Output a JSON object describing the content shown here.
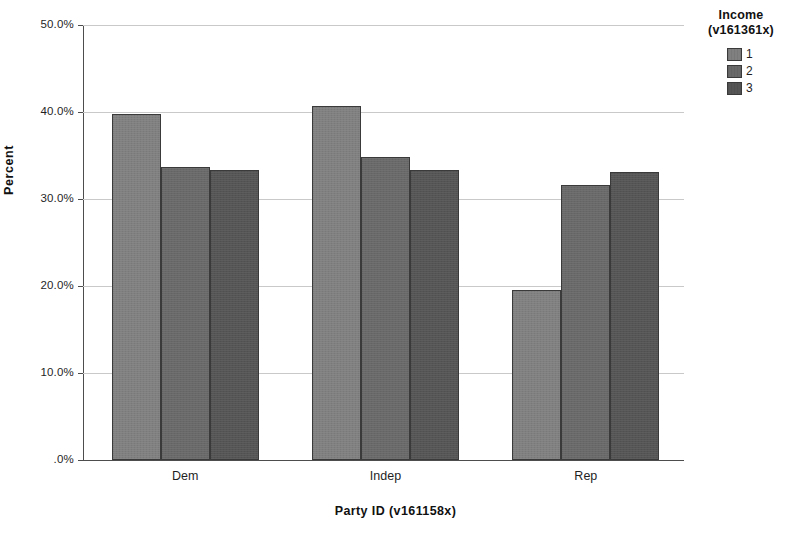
{
  "chart_data": {
    "type": "bar",
    "title": "",
    "xlabel": "Party  ID (v161158x)",
    "ylabel": "Percent",
    "categories": [
      "Dem",
      "Indep",
      "Rep"
    ],
    "series": [
      {
        "name": "1",
        "values": [
          39.8,
          40.7,
          19.5
        ],
        "color": "#808080"
      },
      {
        "name": "2",
        "values": [
          33.7,
          34.8,
          31.6
        ],
        "color": "#696969"
      },
      {
        "name": "3",
        "values": [
          33.3,
          33.3,
          33.1
        ],
        "color": "#555555"
      }
    ],
    "ylim": [
      0,
      50
    ],
    "ytick_values": [
      0,
      10,
      20,
      30,
      40,
      50
    ],
    "ytick_labels": [
      ".0%",
      "10.0%",
      "20.0%",
      "30.0%",
      "40.0%",
      "50.0%"
    ],
    "grid": true,
    "legend_position": "right",
    "legend_title": "Income\n(v161361x)"
  },
  "axes": {
    "y_title": "Percent",
    "x_title": "Party  ID (v161158x)",
    "y_ticks": [
      {
        "label": "50.0%",
        "value": 50
      },
      {
        "label": "40.0%",
        "value": 40
      },
      {
        "label": "30.0%",
        "value": 30
      },
      {
        "label": "20.0%",
        "value": 20
      },
      {
        "label": "10.0%",
        "value": 10
      },
      {
        "label": ".0%",
        "value": 0
      }
    ],
    "x_ticks": [
      {
        "label": "Dem"
      },
      {
        "label": "Indep"
      },
      {
        "label": "Rep"
      }
    ]
  },
  "legend": {
    "title_line1": "Income",
    "title_line2": "(v161361x)",
    "items": [
      {
        "label": "1",
        "color": "#808080"
      },
      {
        "label": "2",
        "color": "#696969"
      },
      {
        "label": "3",
        "color": "#555555"
      }
    ]
  },
  "artifact": {
    "footer_text": ""
  }
}
